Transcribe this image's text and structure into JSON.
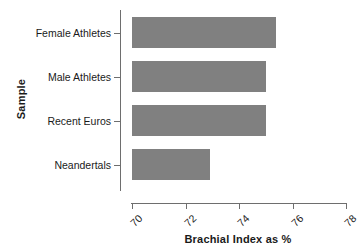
{
  "chart_data": {
    "type": "bar",
    "orientation": "horizontal",
    "title": "",
    "xlabel": "Brachial Index as %",
    "ylabel": "Sample",
    "categories": [
      "Female Athletes",
      "Male Athletes",
      "Recent Euros",
      "Neandertals"
    ],
    "values": [
      75.4,
      75.0,
      75.0,
      72.9
    ],
    "xlim": [
      70,
      78
    ],
    "xticks": [
      70,
      72,
      74,
      76,
      78
    ],
    "xtick_labels": [
      "70",
      "72",
      "74",
      "76",
      "78"
    ],
    "grid": false,
    "legend": false,
    "bar_color": "#808080",
    "axis_color": "#6e6e6e",
    "text_color": "#1a1a1a"
  }
}
